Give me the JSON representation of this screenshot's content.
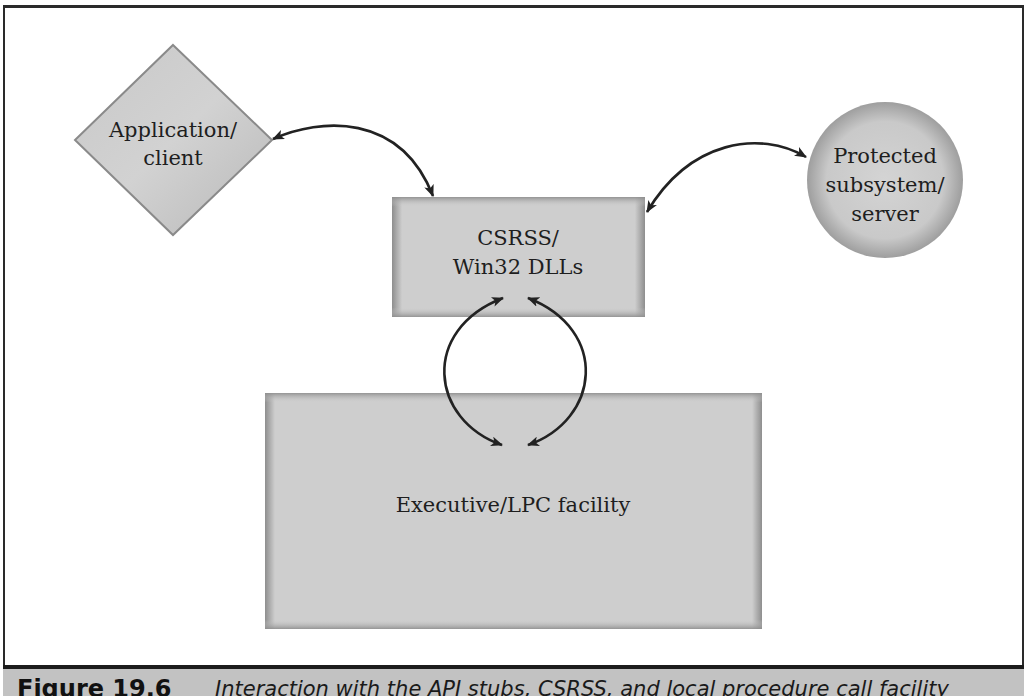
{
  "figure": {
    "number": "Figure 19.6",
    "caption": "Interaction with the API stubs, CSRSS, and local procedure call facility"
  },
  "nodes": {
    "application_client": {
      "shape": "diamond",
      "line1": "Application/",
      "line2": "client"
    },
    "csrss": {
      "shape": "rectangle",
      "line1": "CSRSS/",
      "line2": "Win32 DLLs"
    },
    "protected_subsystem": {
      "shape": "circle",
      "line1": "Protected",
      "line2": "subsystem/",
      "line3": "server"
    },
    "executive": {
      "shape": "rectangle",
      "line1": "Executive/LPC facility"
    }
  },
  "edges": [
    {
      "from": "application_client",
      "to": "csrss",
      "direction": "bidirectional"
    },
    {
      "from": "csrss",
      "to": "protected_subsystem",
      "direction": "bidirectional"
    },
    {
      "from": "csrss",
      "to": "executive",
      "direction": "bidirectional",
      "count": 2
    }
  ],
  "colors": {
    "node_fill": "#cdcdcd",
    "node_edge": "#8a8a8a",
    "arrow": "#222222",
    "caption_band": "#c2c2c2",
    "frame": "#2a2a2a"
  }
}
